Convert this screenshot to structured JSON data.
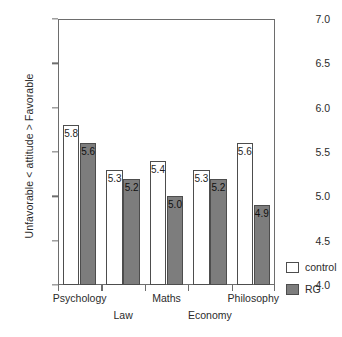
{
  "chart_data": {
    "type": "bar",
    "title": "",
    "subtitle": "",
    "xlabel": "",
    "ylabel": "Unfavorable < attitude > Favorable",
    "ylim": [
      4.0,
      7.0
    ],
    "ytick_labels": [
      "7.0",
      "6.5",
      "6.0",
      "5.5",
      "5.0",
      "4.5",
      "4.0"
    ],
    "ytick_values": [
      7.0,
      6.5,
      6.0,
      5.5,
      5.0,
      4.5,
      4.0
    ],
    "grid": false,
    "legend_position": "right-bottom",
    "categories": [
      "Psychology",
      "Law",
      "Maths",
      "Economy",
      "Philosophy"
    ],
    "series": [
      {
        "name": "control",
        "values": [
          5.8,
          5.3,
          5.4,
          5.3,
          5.6
        ],
        "labels": [
          "5.8",
          "5.3",
          "5.4",
          "5.3",
          "5.6"
        ],
        "color": "#ffffff",
        "edge_color": "#4d4d4d"
      },
      {
        "name": "RG",
        "values": [
          5.6,
          5.2,
          5.0,
          5.2,
          4.9
        ],
        "labels": [
          "5.6",
          "5.2",
          "5.0",
          "5.2",
          "4.9"
        ],
        "color": "#7d7d7d",
        "edge_color": "#4d4d4d"
      }
    ]
  },
  "legend": {
    "items": [
      {
        "label": "control",
        "swatch": "control"
      },
      {
        "label": "RG",
        "swatch": "rg"
      }
    ]
  },
  "colors": {
    "axis": "#6d6d6d",
    "text": "#2b2b2b",
    "bar_control_fill": "#ffffff",
    "bar_rg_fill": "#7d7d7d",
    "bar_edge": "#4d4d4d",
    "background": "#ffffff"
  }
}
